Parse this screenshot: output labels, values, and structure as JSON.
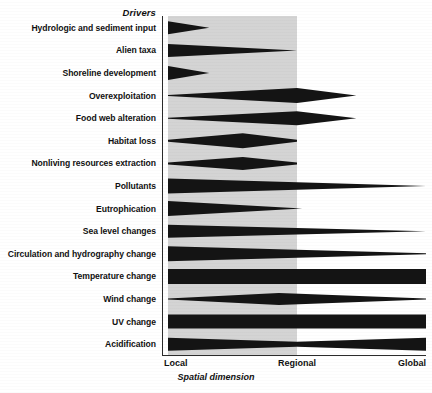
{
  "figure": {
    "header": "Drivers",
    "axis_caption": "Spatial dimension",
    "colors": {
      "shape_fill": "#141414",
      "shaded_band": "#d4d4d4",
      "axis": "#2b2b2b",
      "background": "#ffffff"
    }
  },
  "axis": {
    "ticks": [
      {
        "label": "Local",
        "x_pct": 0
      },
      {
        "label": "Regional",
        "x_pct": 50
      },
      {
        "label": "Global",
        "x_pct": 100
      }
    ]
  },
  "chart_data": {
    "type": "area",
    "title": "Drivers",
    "xlabel": "Spatial dimension",
    "ylabel": "Drivers",
    "xlim": [
      0,
      100
    ],
    "x_tick_labels": [
      "Local",
      "Regional",
      "Global"
    ],
    "x_tick_values": [
      0,
      50,
      100
    ],
    "grid": false,
    "legend": "none",
    "shaded_region": {
      "from": 0,
      "to": 50,
      "color": "#d4d4d4"
    },
    "categories": [
      "Hydrologic and sediment input",
      "Alien taxa",
      "Shoreline development",
      "Overexploitation",
      "Food web alteration",
      "Habitat loss",
      "Nonliving resources extraction",
      "Pollutants",
      "Eutrophication",
      "Sea level changes",
      "Circulation and hydrography change",
      "Temperature change",
      "Wind change",
      "UV change",
      "Acidification"
    ],
    "series": [
      {
        "name": "Hydrologic and sediment input",
        "shape": "wedge-decreasing",
        "x": [
          0,
          16
        ],
        "thickness": [
          13,
          0
        ],
        "extent": [
          0,
          16
        ]
      },
      {
        "name": "Alien taxa",
        "shape": "wedge-decreasing",
        "x": [
          0,
          50
        ],
        "thickness": [
          13,
          0
        ],
        "extent": [
          0,
          50
        ]
      },
      {
        "name": "Shoreline development",
        "shape": "wedge-decreasing",
        "x": [
          0,
          16
        ],
        "thickness": [
          14,
          0
        ],
        "extent": [
          0,
          16
        ]
      },
      {
        "name": "Overexploitation",
        "shape": "lens-peak",
        "x": [
          0,
          50,
          73
        ],
        "thickness": [
          1,
          15,
          0
        ],
        "extent": [
          0,
          73
        ]
      },
      {
        "name": "Food web alteration",
        "shape": "lens-peak",
        "x": [
          0,
          50,
          73
        ],
        "thickness": [
          1,
          14,
          0
        ],
        "extent": [
          0,
          73
        ]
      },
      {
        "name": "Habitat loss",
        "shape": "lens-peak",
        "x": [
          0,
          29,
          50
        ],
        "thickness": [
          2,
          15,
          2
        ],
        "extent": [
          0,
          50
        ]
      },
      {
        "name": "Nonliving resources extraction",
        "shape": "lens-peak",
        "x": [
          0,
          29,
          50
        ],
        "thickness": [
          2,
          13,
          2
        ],
        "extent": [
          0,
          50
        ]
      },
      {
        "name": "Pollutants",
        "shape": "wedge-decreasing",
        "x": [
          0,
          100
        ],
        "thickness": [
          15,
          0
        ],
        "extent": [
          0,
          100
        ]
      },
      {
        "name": "Eutrophication",
        "shape": "wedge-decreasing",
        "x": [
          0,
          52
        ],
        "thickness": [
          15,
          0
        ],
        "extent": [
          0,
          52
        ]
      },
      {
        "name": "Sea level changes",
        "shape": "wedge-decreasing",
        "x": [
          0,
          100
        ],
        "thickness": [
          13,
          0
        ],
        "extent": [
          0,
          100
        ]
      },
      {
        "name": "Circulation and hydrography change",
        "shape": "wedge-decreasing",
        "x": [
          0,
          100
        ],
        "thickness": [
          15,
          1
        ],
        "extent": [
          0,
          100
        ]
      },
      {
        "name": "Temperature change",
        "shape": "band",
        "x": [
          0,
          100
        ],
        "thickness": [
          15,
          15
        ],
        "extent": [
          0,
          100
        ]
      },
      {
        "name": "Wind change",
        "shape": "lens-peak",
        "x": [
          0,
          43,
          100
        ],
        "thickness": [
          1,
          12,
          1
        ],
        "extent": [
          0,
          100
        ]
      },
      {
        "name": "UV change",
        "shape": "band",
        "x": [
          0,
          100
        ],
        "thickness": [
          14,
          14
        ],
        "extent": [
          0,
          100
        ]
      },
      {
        "name": "Acidification",
        "shape": "waist",
        "x": [
          0,
          50,
          100
        ],
        "thickness": [
          13,
          5,
          13
        ],
        "extent": [
          0,
          100
        ]
      }
    ]
  }
}
